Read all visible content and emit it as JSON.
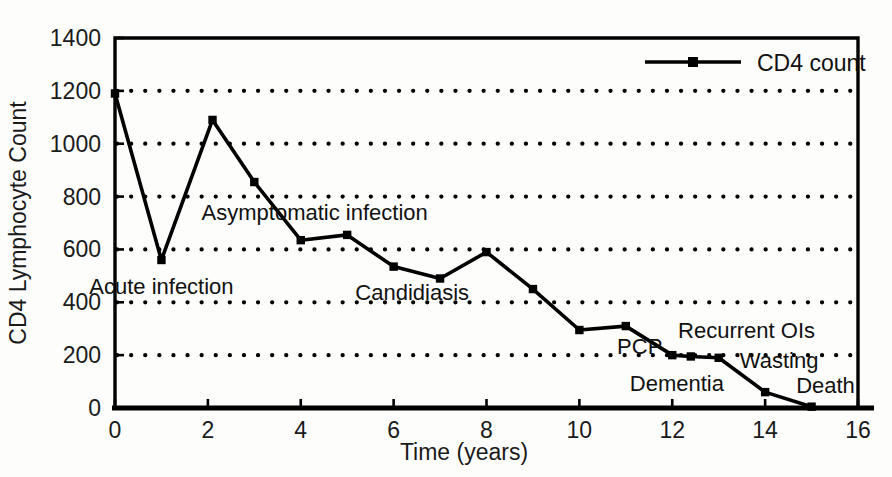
{
  "chart_data": {
    "type": "line",
    "title": "",
    "xlabel": "Time (years)",
    "ylabel": "CD4 Lymphocyte Count",
    "xlim": [
      0,
      16
    ],
    "ylim": [
      0,
      1400
    ],
    "xticks": [
      0,
      2,
      4,
      6,
      8,
      10,
      12,
      14,
      16
    ],
    "yticks": [
      0,
      200,
      400,
      600,
      800,
      1000,
      1200,
      1400
    ],
    "grid": "horizontal-dotted",
    "legend_position": "top-right",
    "series": [
      {
        "name": "CD4 count",
        "marker": "square",
        "x": [
          0,
          1,
          2.1,
          3,
          4,
          5,
          6,
          7,
          8,
          9,
          10,
          11,
          12,
          12.4,
          13,
          14,
          15
        ],
        "values": [
          1190,
          560,
          1090,
          855,
          635,
          655,
          535,
          490,
          590,
          450,
          295,
          310,
          200,
          195,
          190,
          60,
          5
        ]
      }
    ],
    "annotations": [
      {
        "text": "Acute infection",
        "x": 1.0,
        "y": 430
      },
      {
        "text": "Asymptomatic infection",
        "x": 4.3,
        "y": 710
      },
      {
        "text": "Candidiasis",
        "x": 6.4,
        "y": 410
      },
      {
        "text": "PCP",
        "x": 11.3,
        "y": 205
      },
      {
        "text": "Recurrent OIs",
        "x": 13.6,
        "y": 265
      },
      {
        "text": "Wasting",
        "x": 14.3,
        "y": 150
      },
      {
        "text": "Dementia",
        "x": 12.1,
        "y": 65
      },
      {
        "text": "Death",
        "x": 15.3,
        "y": 55
      }
    ],
    "legend": [
      {
        "label": "CD4 count"
      }
    ]
  },
  "axis": {
    "y_title": "CD4 Lymphocyte Count",
    "x_title": "Time (years)",
    "x_tick_labels": [
      "0",
      "2",
      "4",
      "6",
      "8",
      "10",
      "12",
      "14",
      "16"
    ],
    "y_tick_labels": [
      "0",
      "200",
      "400",
      "600",
      "800",
      "1000",
      "1200",
      "1400"
    ]
  },
  "legend": {
    "cd4_label": "CD4 count"
  },
  "annotations": {
    "acute": "Acute infection",
    "asymptomatic": "Asymptomatic infection",
    "candidiasis": "Candidiasis",
    "pcp": "PCP",
    "recurrent": "Recurrent OIs",
    "wasting": "Wasting",
    "dementia": "Dementia",
    "death": "Death"
  },
  "colors": {
    "line": "#000000",
    "grid": "#000000",
    "axis": "#000000",
    "background": "#fdfdfc"
  }
}
